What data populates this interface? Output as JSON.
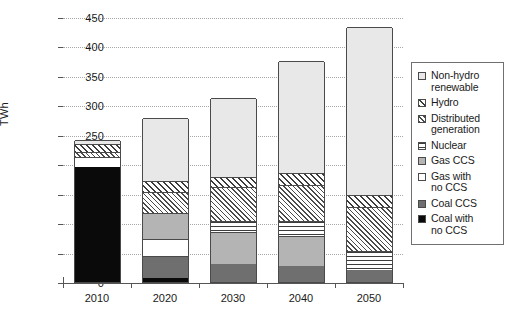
{
  "chart_data": {
    "type": "bar",
    "subtype": "stacked-bar",
    "title": "",
    "xlabel": "",
    "ylabel": "TWh",
    "ylim": [
      0,
      450
    ],
    "ytick_step": 50,
    "yticks": [
      0,
      50,
      100,
      150,
      200,
      250,
      300,
      350,
      400,
      450
    ],
    "grid": true,
    "grid_axis": "y",
    "grid_style": "dotted",
    "legend_position": "right",
    "categories": [
      "2010",
      "2020",
      "2030",
      "2040",
      "2050"
    ],
    "series": [
      {
        "name": "Coal with no CCS",
        "pattern": "solid-black",
        "values": [
          195,
          7,
          0,
          0,
          0
        ]
      },
      {
        "name": "Coal CCS",
        "pattern": "solid-dark-grey",
        "values": [
          0,
          38,
          30,
          28,
          20
        ]
      },
      {
        "name": "Gas with no CCS",
        "pattern": "solid-white",
        "values": [
          17,
          28,
          0,
          0,
          0
        ]
      },
      {
        "name": "Gas CCS",
        "pattern": "solid-mid-grey",
        "values": [
          0,
          45,
          55,
          50,
          0
        ]
      },
      {
        "name": "Nuclear",
        "pattern": "horizontal-lines",
        "values": [
          0,
          0,
          18,
          25,
          32
        ]
      },
      {
        "name": "Distributed generation",
        "pattern": "cross-hatch",
        "values": [
          8,
          35,
          58,
          62,
          76
        ]
      },
      {
        "name": "Hydro",
        "pattern": "diagonal-hatch",
        "values": [
          14,
          18,
          18,
          20,
          20
        ]
      },
      {
        "name": "Non-hydro renewable",
        "pattern": "solid-light-grey",
        "values": [
          8,
          107,
          134,
          190,
          285
        ]
      }
    ],
    "totals": [
      242,
      278,
      313,
      375,
      433
    ],
    "legend_entries": [
      "Non-hydro\nrenewable",
      "Hydro",
      "Distributed\ngeneration",
      "Nuclear",
      "Gas CCS",
      "Gas with\nno CCS",
      "Coal CCS",
      "Coal with\nno CCS"
    ],
    "colors": {
      "coal_no_ccs": "#0a0a0a",
      "coal_ccs": "#6f6f6f",
      "gas_no_ccs": "#ffffff",
      "gas_ccs": "#b4b4b4",
      "nuclear": "#ffffff",
      "distributed": "#ffffff",
      "hydro": "#ffffff",
      "renewable": "#e8e8e8",
      "axis": "#555555",
      "grid": "#a8a8a8",
      "outline": "#4a4a4a"
    }
  },
  "axis": {
    "y_title": "TWh",
    "y_tick_labels": [
      "0",
      "50",
      "100",
      "150",
      "200",
      "250",
      "300",
      "350",
      "400",
      "450"
    ],
    "x_tick_labels": [
      "2010",
      "2020",
      "2030",
      "2040",
      "2050"
    ]
  },
  "legend": {
    "items": [
      {
        "label": "Non-hydro\nrenewable",
        "swatch": "p-renewable"
      },
      {
        "label": "Hydro",
        "swatch": "p-hydro"
      },
      {
        "label": "Distributed\ngeneration",
        "swatch": "p-distributed"
      },
      {
        "label": "Nuclear",
        "swatch": "p-nuclear"
      },
      {
        "label": "Gas CCS",
        "swatch": "p-gas-ccs"
      },
      {
        "label": "Gas with\nno CCS",
        "swatch": "p-gas-nocss"
      },
      {
        "label": "Coal CCS",
        "swatch": "p-coal-ccs"
      },
      {
        "label": "Coal with\nno CCS",
        "swatch": "p-coal-nocss"
      }
    ]
  }
}
